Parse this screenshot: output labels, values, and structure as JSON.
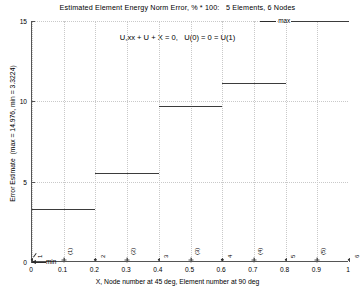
{
  "chart_data": {
    "type": "bar",
    "title": "Estimated Element Energy Norm Error, % * 100:   5 Elements, 6 Nodes",
    "xlabel": "X, Node number at 45 deg, Element number at 90 deg",
    "ylabel": "Error Estimate  (max = 14.976, min = 3.3224)",
    "annotation": "U,xx + U + X = 0,   U(0) = 0 = U(1)",
    "xlim": [
      0,
      1
    ],
    "ylim": [
      0,
      15
    ],
    "grid": true,
    "legend": false,
    "xticks": [
      "0",
      "0.1",
      "0.2",
      "0.3",
      "0.4",
      "0.5",
      "0.6",
      "0.7",
      "0.8",
      "0.9",
      "1"
    ],
    "xtick_values": [
      0,
      0.1,
      0.2,
      0.3,
      0.4,
      0.5,
      0.6,
      0.7,
      0.8,
      0.9,
      1
    ],
    "yticks": [
      "0",
      "5",
      "10",
      "15"
    ],
    "ytick_values": [
      0,
      5,
      10,
      15
    ],
    "categories": [
      "(1)",
      "(2)",
      "(3)",
      "(4)",
      "(5)"
    ],
    "x_edges": [
      0,
      0.2,
      0.4,
      0.6,
      0.8,
      1.0
    ],
    "values": [
      3.3224,
      5.52,
      9.72,
      11.14,
      14.976
    ],
    "max_value": 14.976,
    "min_value": 3.3224,
    "max_label": "max",
    "min_label": "min",
    "node_labels": [
      "1",
      "2",
      "3",
      "4",
      "5",
      "6"
    ],
    "node_x": [
      0,
      0.2,
      0.4,
      0.6,
      0.8,
      1.0
    ],
    "element_labels": [
      "(1)",
      "(2)",
      "(3)",
      "(4)",
      "(5)"
    ],
    "element_x": [
      0.1,
      0.3,
      0.5,
      0.7,
      0.9
    ],
    "line_color": "#3b3b3b",
    "grid_color": "#c9c9c9",
    "axis_color": "#555555"
  }
}
